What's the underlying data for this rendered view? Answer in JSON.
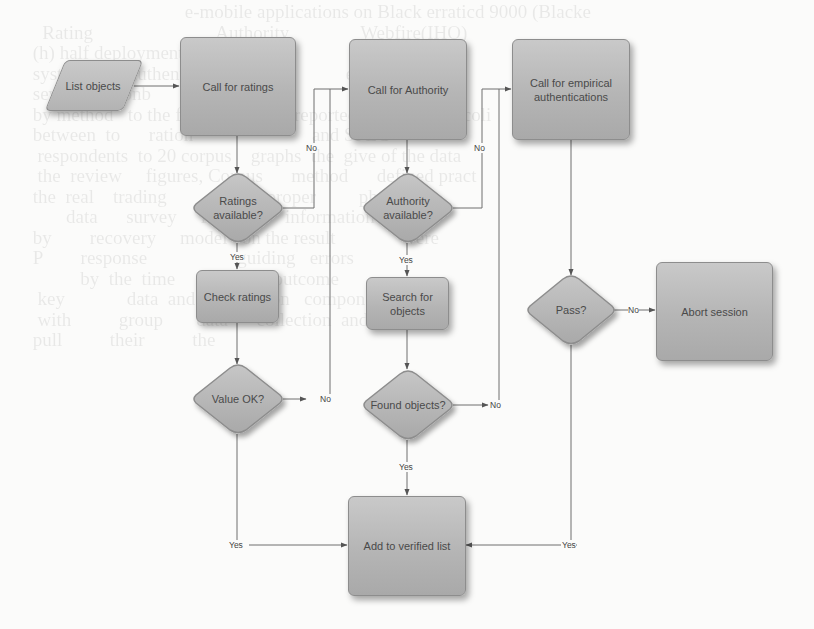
{
  "diagram": {
    "type": "flowchart",
    "nodes": {
      "list_objects": {
        "label": "List objects",
        "shape": "parallelogram"
      },
      "call_ratings": {
        "label": "Call for ratings",
        "shape": "process"
      },
      "call_authority": {
        "label": "Call for Authority",
        "shape": "process"
      },
      "call_empirical": {
        "label": "Call for empirical authentications",
        "shape": "process"
      },
      "ratings_available": {
        "label": "Ratings available?",
        "shape": "decision"
      },
      "authority_available": {
        "label": "Authority available?",
        "shape": "decision"
      },
      "check_ratings": {
        "label": "Check ratings",
        "shape": "process"
      },
      "search_objects": {
        "label": "Search for objects",
        "shape": "process"
      },
      "value_ok": {
        "label": "Value OK?",
        "shape": "decision"
      },
      "found_objects": {
        "label": "Found objects?",
        "shape": "decision"
      },
      "pass": {
        "label": "Pass?",
        "shape": "decision"
      },
      "abort_session": {
        "label": "Abort session",
        "shape": "process"
      },
      "add_verified": {
        "label": "Add to verified list",
        "shape": "process"
      }
    },
    "edge_labels": {
      "yes": "Yes",
      "no": "No"
    },
    "edges": [
      {
        "from": "list_objects",
        "to": "call_ratings",
        "label": ""
      },
      {
        "from": "call_ratings",
        "to": "ratings_available",
        "label": ""
      },
      {
        "from": "ratings_available",
        "to": "call_authority",
        "label": "No"
      },
      {
        "from": "ratings_available",
        "to": "check_ratings",
        "label": "Yes"
      },
      {
        "from": "check_ratings",
        "to": "value_ok",
        "label": ""
      },
      {
        "from": "value_ok",
        "to": "call_authority",
        "label": "No"
      },
      {
        "from": "value_ok",
        "to": "add_verified",
        "label": "Yes"
      },
      {
        "from": "call_authority",
        "to": "authority_available",
        "label": ""
      },
      {
        "from": "authority_available",
        "to": "call_empirical",
        "label": "No"
      },
      {
        "from": "authority_available",
        "to": "search_objects",
        "label": "Yes"
      },
      {
        "from": "search_objects",
        "to": "found_objects",
        "label": ""
      },
      {
        "from": "found_objects",
        "to": "call_empirical",
        "label": "No"
      },
      {
        "from": "found_objects",
        "to": "add_verified",
        "label": "Yes"
      },
      {
        "from": "call_empirical",
        "to": "pass",
        "label": ""
      },
      {
        "from": "pass",
        "to": "abort_session",
        "label": "No"
      },
      {
        "from": "pass",
        "to": "add_verified",
        "label": "Yes"
      }
    ]
  },
  "background_text": "n     e-mobile applications on Black erraticd 9000 (Blacka\n  ... faint scanned paper text behind the diagram ..."
}
